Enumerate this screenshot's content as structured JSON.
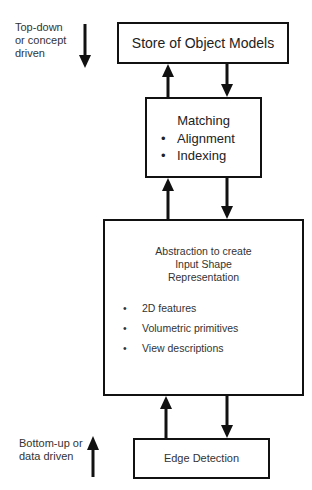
{
  "diagram": {
    "title": "",
    "side_labels": {
      "top": [
        "Top-down",
        "or concept",
        "driven"
      ],
      "bottom": [
        "Bottom-up or",
        "data driven"
      ]
    },
    "boxes": [
      {
        "id": "store",
        "title": "Store of Object Models",
        "bullets": []
      },
      {
        "id": "matching",
        "title": "Matching",
        "bullets": [
          "Alignment",
          "Indexing"
        ]
      },
      {
        "id": "abstraction",
        "title_lines": [
          "Abstraction to create",
          "Input Shape",
          "Representation"
        ],
        "bullets": [
          "2D features",
          "Volumetric primitives",
          "View descriptions"
        ]
      },
      {
        "id": "edge",
        "title": "Edge Detection",
        "bullets": []
      }
    ],
    "bullet_glyph": "•",
    "connections": [
      {
        "from": "matching",
        "to": "store",
        "direction": "up"
      },
      {
        "from": "store",
        "to": "matching",
        "direction": "down"
      },
      {
        "from": "abstraction",
        "to": "matching",
        "direction": "up"
      },
      {
        "from": "matching",
        "to": "abstraction",
        "direction": "down"
      },
      {
        "from": "edge",
        "to": "abstraction",
        "direction": "up"
      },
      {
        "from": "abstraction",
        "to": "edge",
        "direction": "down"
      }
    ],
    "colors": {
      "stroke": "#111111",
      "text": "#222222",
      "background": "#ffffff"
    }
  }
}
